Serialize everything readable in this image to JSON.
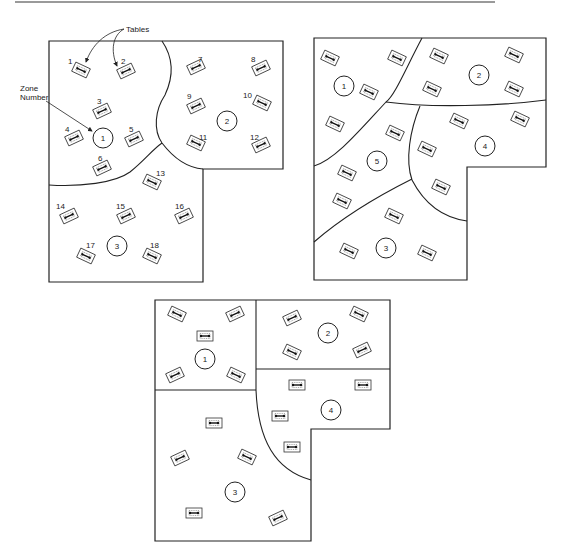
{
  "annotations": {
    "tables_label": "Tables",
    "zone_number_label_line1": "Zone",
    "zone_number_label_line2": "Number"
  },
  "diagrams": [
    {
      "name": "layout-a",
      "zones": [
        "1",
        "2",
        "3"
      ],
      "table_numbers": [
        "1",
        "2",
        "3",
        "4",
        "5",
        "6",
        "7",
        "8",
        "9",
        "10",
        "11",
        "12",
        "13",
        "14",
        "15",
        "16",
        "17",
        "18"
      ]
    },
    {
      "name": "layout-b",
      "zones": [
        "1",
        "2",
        "3",
        "4",
        "5"
      ]
    },
    {
      "name": "layout-c",
      "zones": [
        "1",
        "2",
        "3",
        "4"
      ]
    }
  ]
}
